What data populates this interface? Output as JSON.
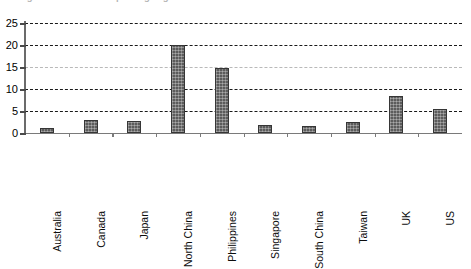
{
  "title": {
    "clipped_text": "Figure: Number of reporting organisations"
  },
  "chart_data": {
    "type": "bar",
    "title": "",
    "xlabel": "",
    "ylabel": "",
    "ylim": [
      0,
      25
    ],
    "yticks": [
      0,
      5,
      10,
      15,
      20,
      25
    ],
    "grid": true,
    "legend": "none",
    "categories": [
      "Australia",
      "Canada",
      "Japan",
      "North China",
      "Philippines",
      "Singapore",
      "South China",
      "Taiwan",
      "UK",
      "US"
    ],
    "values": [
      1.1,
      2.9,
      2.8,
      20.0,
      14.7,
      1.8,
      1.7,
      2.6,
      8.4,
      5.4
    ],
    "series": [
      {
        "name": "Series 1",
        "values": [
          1.1,
          2.9,
          2.8,
          20.0,
          14.7,
          1.8,
          1.7,
          2.6,
          8.4,
          5.4
        ]
      }
    ]
  },
  "style": {
    "bar_fill": "#5c5c5c",
    "bar_border": "#363636",
    "gridline": "#1a1a1a",
    "gridline_faint": "#b9b9b9",
    "axis": "#7a7a7a",
    "background": "#ffffff"
  }
}
